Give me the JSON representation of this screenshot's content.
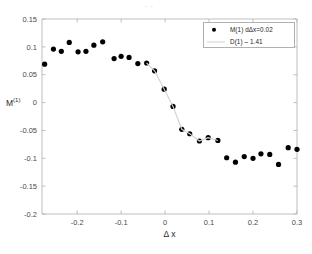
{
  "figure": {
    "title_remnant": "- -",
    "background_color": "#ffffff",
    "axis_color": "#b8b8b8",
    "marker_color": "#000000",
    "fit_line_color": "#d2d2d2"
  },
  "legend": {
    "position": "top-right",
    "entries": [
      {
        "label": "M(1)  dΔx=0.02",
        "marker": "filled-circle",
        "color": "#000000"
      },
      {
        "label": "D(1) – 1.41",
        "marker": "line",
        "color": "#d2d2d2"
      }
    ]
  },
  "chart_data": {
    "type": "scatter",
    "title": "",
    "xlabel": "Δ x",
    "ylabel": "M(1)",
    "ylabel_base": "M",
    "ylabel_sup": "(1)",
    "xlim": [
      -0.28,
      0.3
    ],
    "ylim": [
      -0.2,
      0.15
    ],
    "xticks": [
      -0.2,
      -0.1,
      0,
      0.1,
      0.2,
      0.3
    ],
    "xticklabels": [
      "-0.2",
      "-0.1",
      "0",
      "0.1",
      "0.2",
      "0.3"
    ],
    "yticks": [
      0.15,
      0.1,
      0.05,
      0,
      -0.05,
      -0.1,
      -0.15,
      -0.2
    ],
    "yticklabels": [
      "0.15",
      "0.1",
      "0.05",
      "0",
      "-0.05",
      "-0.1",
      "-0.15",
      "-0.2"
    ],
    "grid": false,
    "legend_position": "upper right",
    "series": [
      {
        "name": "M(1)  dΔx=0.02",
        "type": "scatter",
        "marker": "filled-circle",
        "color": "#000000",
        "x": [
          -0.274,
          -0.254,
          -0.236,
          -0.218,
          -0.198,
          -0.18,
          -0.162,
          -0.142,
          -0.116,
          -0.1,
          -0.082,
          -0.062,
          -0.042,
          -0.024,
          -0.002,
          0.018,
          0.038,
          0.056,
          0.078,
          0.098,
          0.12,
          0.14,
          0.16,
          0.18,
          0.2,
          0.218,
          0.238,
          0.258,
          0.28,
          0.3
        ],
        "y": [
          0.069,
          0.096,
          0.092,
          0.108,
          0.091,
          0.092,
          0.103,
          0.109,
          0.079,
          0.083,
          0.081,
          0.07,
          0.071,
          0.057,
          0.024,
          -0.007,
          -0.048,
          -0.056,
          -0.069,
          -0.063,
          -0.068,
          -0.099,
          -0.107,
          -0.097,
          -0.1,
          -0.092,
          -0.093,
          -0.111,
          -0.081,
          -0.084
        ]
      },
      {
        "name": "D(1) – 1.41",
        "type": "line",
        "color": "#d2d2d2",
        "x": [
          -0.042,
          -0.024,
          -0.002,
          0.018,
          0.038,
          0.056,
          0.078,
          0.098,
          0.12
        ],
        "y": [
          0.071,
          0.057,
          0.024,
          -0.007,
          -0.048,
          -0.056,
          -0.069,
          -0.063,
          -0.068
        ]
      }
    ]
  }
}
